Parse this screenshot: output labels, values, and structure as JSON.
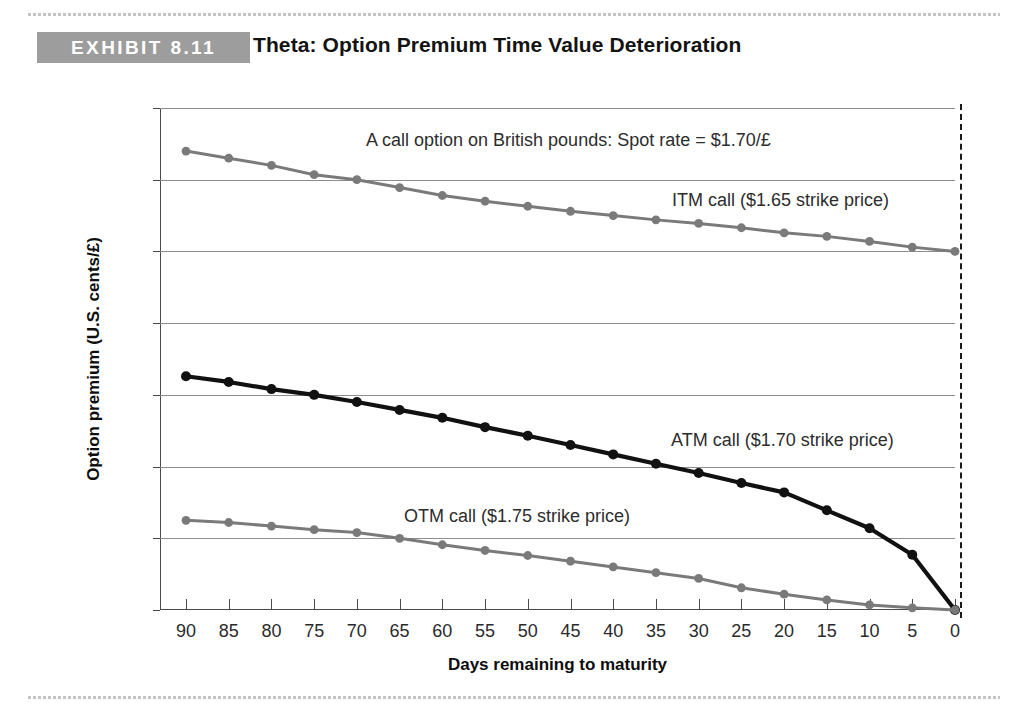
{
  "header": {
    "badge": "EXHIBIT 8.11",
    "title": "Theta: Option Premium Time Value Deterioration",
    "badge_color": "#9d9d9d"
  },
  "chart_data": {
    "type": "line",
    "title": "Theta: Option Premium Time Value Deterioration",
    "subtitle": "A call option on British pounds: Spot rate = $1.70/£",
    "xlabel": "Days remaining to maturity",
    "ylabel": "Option premium (U.S. cents/£)",
    "x": [
      90,
      85,
      80,
      75,
      70,
      65,
      60,
      55,
      50,
      45,
      40,
      35,
      30,
      25,
      20,
      15,
      10,
      5,
      0
    ],
    "xticklabels": [
      "90",
      "85",
      "80",
      "75",
      "70",
      "65",
      "60",
      "55",
      "50",
      "45",
      "40",
      "35",
      "30",
      "25",
      "20",
      "15",
      "10",
      "5",
      "0"
    ],
    "yticks": [
      0.0,
      1.0,
      2.0,
      3.0,
      4.0,
      5.0,
      6.0,
      7.0
    ],
    "yticklabels": [
      "0.0",
      "1.0",
      "2.0",
      "3.0",
      "4.0",
      "5.0",
      "6.0",
      "7.0"
    ],
    "xlim": [
      90,
      0
    ],
    "ylim": [
      0.0,
      7.0
    ],
    "x_reversed": true,
    "grid": "horizontal",
    "legend": "inline-annotations",
    "series": [
      {
        "name": "ITM call ($1.65 strike price)",
        "label": "ITM call ($1.65 strike price)",
        "color": "#7a7a7a",
        "marker": "circle",
        "values": [
          6.4,
          6.3,
          6.2,
          6.07,
          6.0,
          5.89,
          5.78,
          5.7,
          5.63,
          5.56,
          5.5,
          5.44,
          5.39,
          5.33,
          5.26,
          5.21,
          5.14,
          5.06,
          5.0
        ]
      },
      {
        "name": "ATM call ($1.70 strike price)",
        "label": "ATM call ($1.70 strike price)",
        "color": "#111111",
        "marker": "circle",
        "values": [
          3.26,
          3.18,
          3.08,
          3.0,
          2.9,
          2.79,
          2.68,
          2.55,
          2.43,
          2.3,
          2.17,
          2.04,
          1.91,
          1.77,
          1.64,
          1.39,
          1.14,
          0.77,
          0.0
        ]
      },
      {
        "name": "OTM call ($1.75 strike price)",
        "label": "OTM call ($1.75 strike price)",
        "color": "#7a7a7a",
        "marker": "circle",
        "values": [
          1.25,
          1.22,
          1.17,
          1.12,
          1.08,
          1.0,
          0.91,
          0.83,
          0.76,
          0.68,
          0.6,
          0.52,
          0.44,
          0.31,
          0.22,
          0.14,
          0.07,
          0.03,
          0.0
        ]
      }
    ],
    "annotations": [
      {
        "text": "A call option on British pounds: Spot rate = $1.70/£",
        "x_px": 366,
        "y_px": 130
      },
      {
        "text": "ITM call ($1.65 strike price)",
        "x_px": 672,
        "y_px": 190
      },
      {
        "text": "ATM call ($1.70 strike price)",
        "x_px": 671,
        "y_px": 430
      },
      {
        "text": "OTM call ($1.75 strike price)",
        "x_px": 404,
        "y_px": 506
      }
    ],
    "maturity_marker": {
      "label": "maturity",
      "x": 0,
      "style": "dashed-vertical"
    }
  }
}
